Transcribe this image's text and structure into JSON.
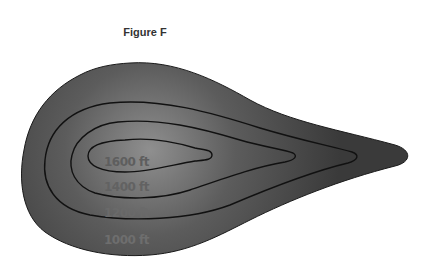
{
  "figure": {
    "title": "Figure F",
    "fill_color": "#4a4a4a",
    "highlight_color": "#8a8a8a",
    "line_color": "#111111",
    "contours": [
      {
        "elevation": "1000 ft",
        "label_color": "#6e6e6e"
      },
      {
        "elevation": "1200 ft",
        "label_color": "#6a6a6a"
      },
      {
        "elevation": "1400 ft",
        "label_color": "#626262"
      },
      {
        "elevation": "1600 ft",
        "label_color": "#5e5e5e"
      }
    ]
  }
}
